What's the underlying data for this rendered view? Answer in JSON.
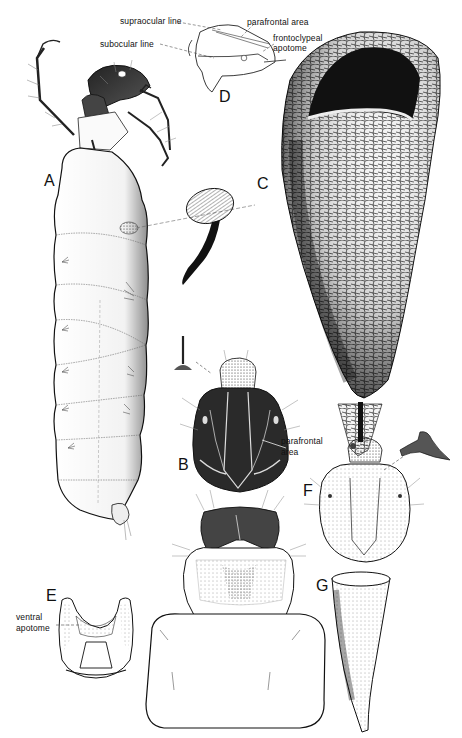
{
  "figure": {
    "type": "scientific-illustration-plate",
    "background": "#ffffff",
    "ink": "#111111",
    "panels": [
      {
        "id": "A",
        "label": "A",
        "subject": "larva, lateral view"
      },
      {
        "id": "B",
        "label": "B",
        "subject": "head, dorsal view"
      },
      {
        "id": "C",
        "label": "C",
        "subject": "larval case"
      },
      {
        "id": "D",
        "label": "D",
        "subject": "head, lateral outline"
      },
      {
        "id": "E",
        "label": "E",
        "subject": "head, ventral view"
      },
      {
        "id": "F",
        "label": "F",
        "subject": "head, dorsal view (second species)"
      },
      {
        "id": "G",
        "label": "G",
        "subject": "larval case (second species)"
      }
    ],
    "annotations": {
      "supraocular": "supraocular line",
      "subocular": "subocular line",
      "parafrontal_d": "parafrontal area",
      "frontoclypeal_1": "frontoclypeal",
      "frontoclypeal_2": "apotome",
      "parafrontal_b_1": "parafrontal",
      "parafrontal_b_2": "area",
      "ventral_1": "ventral",
      "ventral_2": "apotome"
    }
  }
}
